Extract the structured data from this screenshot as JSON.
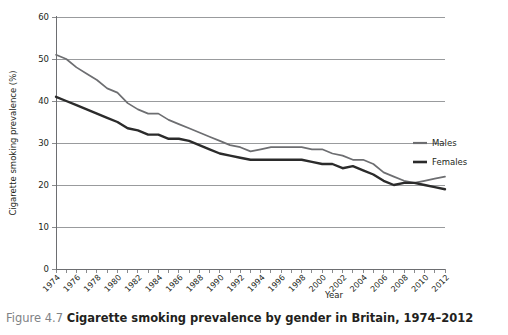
{
  "caption": {
    "number": "Figure 4.7",
    "text": "Cigarette smoking prevalence by gender in Britain, 1974–2012"
  },
  "legend": {
    "position": "right",
    "entries": [
      {
        "label": "Males",
        "color": "#6d6e71"
      },
      {
        "label": "Females",
        "color": "#2b2b2b"
      }
    ]
  },
  "chart_data": {
    "type": "line",
    "title": "",
    "xlabel": "Year",
    "ylabel": "Cigarette smoking prevalence (%)",
    "xlim": [
      1974,
      2012
    ],
    "ylim": [
      0,
      60
    ],
    "ytick_values": [
      0,
      10,
      20,
      30,
      40,
      50,
      60
    ],
    "ytick_labels": [
      "0",
      "10",
      "20",
      "30",
      "40",
      "50",
      "60"
    ],
    "xtick_labels": [
      "1974",
      "1976",
      "1978",
      "1980",
      "1982",
      "1984",
      "1986",
      "1988",
      "1990",
      "1992",
      "1994",
      "1996",
      "1998",
      "2000",
      "2002",
      "2004",
      "2006",
      "2008",
      "2010",
      "2012"
    ],
    "xtick_values": [
      1974,
      1976,
      1978,
      1980,
      1982,
      1984,
      1986,
      1988,
      1990,
      1992,
      1994,
      1996,
      1998,
      2000,
      2002,
      2004,
      2006,
      2008,
      2010,
      2012
    ],
    "minor_xticks_every": 1,
    "grid": "horizontal",
    "x": [
      1974,
      1975,
      1976,
      1977,
      1978,
      1979,
      1980,
      1981,
      1982,
      1983,
      1984,
      1985,
      1986,
      1987,
      1988,
      1989,
      1990,
      1991,
      1992,
      1993,
      1994,
      1995,
      1996,
      1997,
      1998,
      1999,
      2000,
      2001,
      2002,
      2003,
      2004,
      2005,
      2006,
      2007,
      2008,
      2009,
      2010,
      2011,
      2012
    ],
    "series": [
      {
        "name": "Males",
        "color": "#6d6e71",
        "values": [
          51,
          50,
          48,
          46.5,
          45,
          43,
          42,
          39.5,
          38,
          37,
          37,
          35.5,
          34.5,
          33.5,
          32.5,
          31.5,
          30.5,
          29.5,
          29,
          28,
          28.5,
          29,
          29,
          29,
          29,
          28.5,
          28.5,
          27.5,
          27,
          26,
          26,
          25,
          23,
          22,
          21,
          20.5,
          21,
          21.5,
          22
        ]
      },
      {
        "name": "Females",
        "color": "#2b2b2b",
        "values": [
          41,
          40,
          39,
          38,
          37,
          36,
          35,
          33.5,
          33,
          32,
          32,
          31,
          31,
          30.5,
          29.5,
          28.5,
          27.5,
          27,
          26.5,
          26,
          26,
          26,
          26,
          26,
          26,
          25.5,
          25,
          25,
          24,
          24.5,
          23.5,
          22.5,
          21,
          20,
          20.5,
          20.5,
          20,
          19.5,
          19
        ]
      }
    ]
  }
}
